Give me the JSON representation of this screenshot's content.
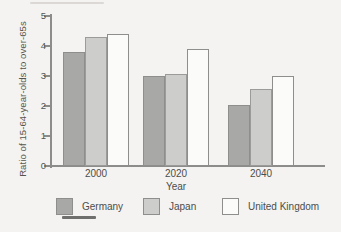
{
  "chart": {
    "ylabel": "Ratio of 15-64-year-olds to over-65s",
    "xlabel": "Year"
  },
  "chart_data": {
    "type": "bar",
    "title": "",
    "categories": [
      "2000",
      "2020",
      "2040"
    ],
    "series": [
      {
        "name": "Germany",
        "values": [
          3.8,
          3.0,
          2.05
        ],
        "fill": "#a8a8a7",
        "border": "#8e8e8d"
      },
      {
        "name": "Japan",
        "values": [
          4.3,
          3.05,
          2.55
        ],
        "fill": "#cdcdcb",
        "border": "#9b9b99"
      },
      {
        "name": "United Kingdom",
        "values": [
          4.4,
          3.9,
          3.0
        ],
        "fill": "#fbfbf9",
        "border": "#8e8e8d"
      }
    ],
    "xlabel": "Year",
    "ylabel": "Ratio of 15-64-year-olds to over-65s",
    "ylim": [
      0,
      5
    ],
    "yticks": [
      0,
      1,
      2,
      3,
      4,
      5
    ],
    "grid": false,
    "legend_position": "bottom",
    "axis_color": "#8c8c8a",
    "text_color": "#4d4d4b"
  }
}
